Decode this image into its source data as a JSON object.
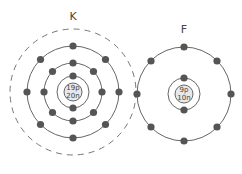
{
  "atoms": [
    {
      "symbol": "K",
      "nucleus": {
        "protons": "19p",
        "neutrons": "20n"
      },
      "shells": [
        2,
        8,
        8
      ],
      "empty_outer_shell": true
    },
    {
      "symbol": "F",
      "nucleus": {
        "protons": "9p",
        "neutrons": "10n"
      },
      "shells": [
        2,
        8
      ],
      "empty_outer_shell": false
    }
  ],
  "colors": {
    "electron": "#555555",
    "orbit": "#666666",
    "nucleus_fill": "#e8e8e8"
  }
}
